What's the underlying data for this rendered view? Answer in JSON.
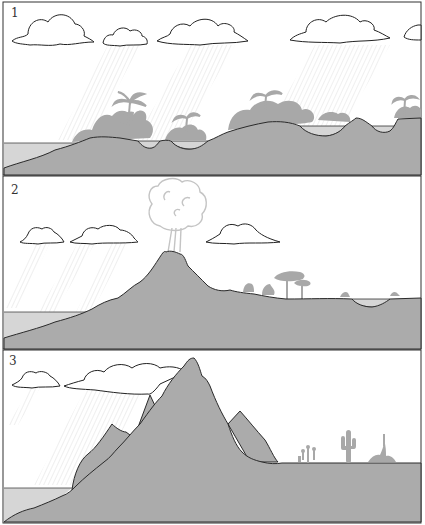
{
  "figure": {
    "colors": {
      "ground": "#ababab",
      "water": "#d6d6d6",
      "vegetation": "#a8a8a8",
      "outline": "#2a2a2a",
      "rain": "#d8d8d8",
      "sky": "#ffffff",
      "plume": "#c4c4c4"
    },
    "panels": [
      {
        "label": "1",
        "title": "Low island with lush tropical vegetation and rain",
        "features": [
          "clouds",
          "rain",
          "sea",
          "low-hills",
          "lakes",
          "palm-trees",
          "rainforest"
        ]
      },
      {
        "label": "2",
        "title": "Volcano erupts and rises; sparse trees on lee side",
        "features": [
          "clouds",
          "rain",
          "sea",
          "volcano",
          "eruption-plume",
          "acacia-trees",
          "shrubs",
          "lake"
        ]
      },
      {
        "label": "3",
        "title": "Tall mountains block rain; desert on lee side",
        "features": [
          "clouds",
          "rain",
          "sea",
          "mountain-peaks",
          "cacti",
          "desert-plants"
        ]
      }
    ]
  }
}
